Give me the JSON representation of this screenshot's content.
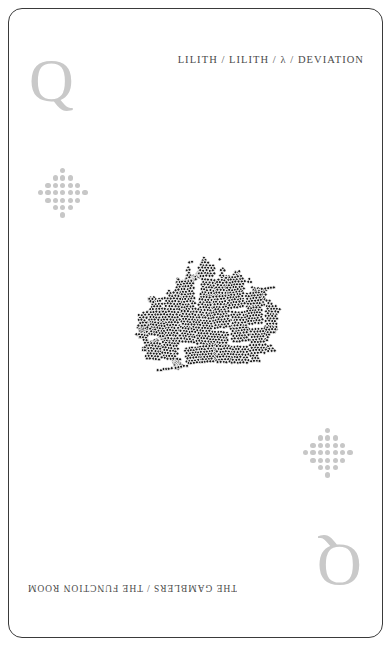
{
  "card": {
    "rank_letter": "Q",
    "rank_color": "#c9c9c9",
    "border_color": "#3a3a3a",
    "background_color": "#ffffff",
    "header_text": "LILITH / LILITH / λ / DEVIATION",
    "footer_text": "THE GAMBLERS / THE FUNCTION ROOM",
    "text_color": "#4a4a4a"
  },
  "pip": {
    "name": "diamond-dot-cluster",
    "dot_color": "#c7c7c7",
    "grid_size": 7,
    "row_counts": [
      1,
      3,
      5,
      7,
      5,
      3,
      1
    ]
  },
  "artwork": {
    "name": "packed-circle-aggregate",
    "description": "dense dendritic cluster of small packed circles",
    "fill_color": "#1a1a1a",
    "stroke_color": "#ffffff",
    "circle_count": 1650,
    "bounds": {
      "x": 133,
      "y": 245,
      "width": 137,
      "height": 158
    }
  }
}
